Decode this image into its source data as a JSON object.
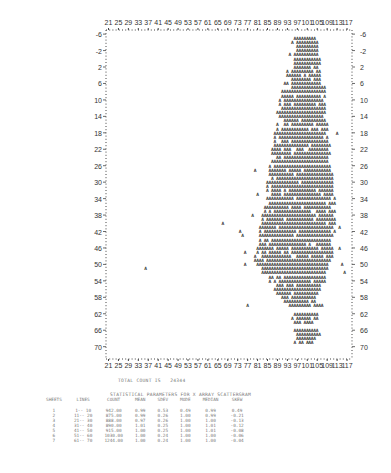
{
  "chart_data": {
    "type": "scatter",
    "title": "",
    "render_style": "line-printer character scattergram",
    "marker_glyph": "A",
    "x_ticks": [
      21,
      25,
      29,
      33,
      37,
      41,
      45,
      49,
      53,
      57,
      61,
      65,
      69,
      73,
      77,
      81,
      85,
      89,
      93,
      97,
      101,
      105,
      109,
      113,
      117
    ],
    "y_ticks": [
      -6,
      -2,
      2,
      6,
      10,
      14,
      18,
      22,
      26,
      30,
      34,
      38,
      42,
      46,
      50,
      54,
      58,
      62,
      66,
      70
    ],
    "xlim": [
      20,
      119
    ],
    "ylim": [
      -7,
      73
    ],
    "y_axis_inverted": true,
    "grid": false,
    "density_rows": [
      {
        "y": -5,
        "xmin": 96,
        "xmax": 104
      },
      {
        "y": -4,
        "xmin": 95,
        "xmax": 105
      },
      {
        "y": -3,
        "xmin": 95,
        "xmax": 105
      },
      {
        "y": -2,
        "xmin": 95,
        "xmax": 106
      },
      {
        "y": -1,
        "xmin": 94,
        "xmax": 105
      },
      {
        "y": 0,
        "xmin": 94,
        "xmax": 106
      },
      {
        "y": 1,
        "xmin": 94,
        "xmax": 106
      },
      {
        "y": 2,
        "xmin": 94,
        "xmax": 105
      },
      {
        "y": 3,
        "xmin": 93,
        "xmax": 106
      },
      {
        "y": 4,
        "xmin": 93,
        "xmax": 106
      },
      {
        "y": 5,
        "xmin": 93,
        "xmax": 107
      },
      {
        "y": 6,
        "xmin": 92,
        "xmax": 107
      },
      {
        "y": 7,
        "xmin": 92,
        "xmax": 108
      },
      {
        "y": 8,
        "xmin": 91,
        "xmax": 108
      },
      {
        "y": 9,
        "xmin": 91,
        "xmax": 108
      },
      {
        "y": 10,
        "xmin": 90,
        "xmax": 108
      },
      {
        "y": 11,
        "xmin": 90,
        "xmax": 108
      },
      {
        "y": 12,
        "xmin": 90,
        "xmax": 108
      },
      {
        "y": 13,
        "xmin": 89,
        "xmax": 108
      },
      {
        "y": 14,
        "xmin": 89,
        "xmax": 108
      },
      {
        "y": 15,
        "xmin": 89,
        "xmax": 108
      },
      {
        "y": 16,
        "xmin": 89,
        "xmax": 109
      },
      {
        "y": 17,
        "xmin": 89,
        "xmax": 109
      },
      {
        "y": 18,
        "xmin": 88,
        "xmax": 109
      },
      {
        "y": 19,
        "xmin": 88,
        "xmax": 109
      },
      {
        "y": 20,
        "xmin": 88,
        "xmax": 109
      },
      {
        "y": 21,
        "xmin": 88,
        "xmax": 110
      },
      {
        "y": 22,
        "xmin": 87,
        "xmax": 110
      },
      {
        "y": 23,
        "xmin": 87,
        "xmax": 110
      },
      {
        "y": 24,
        "xmin": 87,
        "xmax": 110
      },
      {
        "y": 25,
        "xmin": 87,
        "xmax": 110
      },
      {
        "y": 26,
        "xmin": 86,
        "xmax": 110
      },
      {
        "y": 27,
        "xmin": 86,
        "xmax": 110
      },
      {
        "y": 28,
        "xmin": 86,
        "xmax": 111
      },
      {
        "y": 29,
        "xmin": 86,
        "xmax": 111
      },
      {
        "y": 30,
        "xmin": 85,
        "xmax": 111
      },
      {
        "y": 31,
        "xmin": 85,
        "xmax": 111
      },
      {
        "y": 32,
        "xmin": 85,
        "xmax": 111
      },
      {
        "y": 33,
        "xmin": 85,
        "xmax": 111
      },
      {
        "y": 34,
        "xmin": 84,
        "xmax": 112
      },
      {
        "y": 35,
        "xmin": 84,
        "xmax": 112
      },
      {
        "y": 36,
        "xmin": 84,
        "xmax": 112
      },
      {
        "y": 37,
        "xmin": 84,
        "xmax": 112
      },
      {
        "y": 38,
        "xmin": 83,
        "xmax": 112
      },
      {
        "y": 39,
        "xmin": 83,
        "xmax": 112
      },
      {
        "y": 40,
        "xmin": 83,
        "xmax": 112
      },
      {
        "y": 41,
        "xmin": 82,
        "xmax": 112
      },
      {
        "y": 42,
        "xmin": 82,
        "xmax": 112
      },
      {
        "y": 43,
        "xmin": 82,
        "xmax": 112
      },
      {
        "y": 44,
        "xmin": 82,
        "xmax": 111
      },
      {
        "y": 45,
        "xmin": 81,
        "xmax": 111
      },
      {
        "y": 46,
        "xmin": 81,
        "xmax": 111
      },
      {
        "y": 47,
        "xmin": 81,
        "xmax": 111
      },
      {
        "y": 48,
        "xmin": 80,
        "xmax": 111
      },
      {
        "y": 49,
        "xmin": 80,
        "xmax": 110
      },
      {
        "y": 50,
        "xmin": 81,
        "xmax": 110
      },
      {
        "y": 51,
        "xmin": 82,
        "xmax": 110
      },
      {
        "y": 52,
        "xmin": 83,
        "xmax": 109
      },
      {
        "y": 53,
        "xmin": 85,
        "xmax": 108
      },
      {
        "y": 54,
        "xmin": 86,
        "xmax": 108
      },
      {
        "y": 55,
        "xmin": 87,
        "xmax": 107
      },
      {
        "y": 56,
        "xmin": 88,
        "xmax": 106
      },
      {
        "y": 57,
        "xmin": 89,
        "xmax": 105
      },
      {
        "y": 58,
        "xmin": 90,
        "xmax": 104
      },
      {
        "y": 59,
        "xmin": 91,
        "xmax": 105
      },
      {
        "y": 60,
        "xmin": 94,
        "xmax": 107
      },
      {
        "y": 62,
        "xmin": 95,
        "xmax": 106
      },
      {
        "y": 63,
        "xmin": 95,
        "xmax": 105
      },
      {
        "y": 64,
        "xmin": 95,
        "xmax": 104
      },
      {
        "y": 66,
        "xmin": 96,
        "xmax": 105
      },
      {
        "y": 67,
        "xmin": 95,
        "xmax": 106
      },
      {
        "y": 68,
        "xmin": 95,
        "xmax": 104
      },
      {
        "y": 69,
        "xmin": 96,
        "xmax": 103
      }
    ],
    "outliers": [
      {
        "x": 36,
        "y": 51
      },
      {
        "x": 67,
        "y": 40
      },
      {
        "x": 74,
        "y": 42
      },
      {
        "x": 75,
        "y": 43
      },
      {
        "x": 76,
        "y": 47
      },
      {
        "x": 76,
        "y": 50
      },
      {
        "x": 77,
        "y": 60
      },
      {
        "x": 79,
        "y": 38
      },
      {
        "x": 80,
        "y": 27
      },
      {
        "x": 81,
        "y": 33
      },
      {
        "x": 113,
        "y": 18
      },
      {
        "x": 114,
        "y": 41
      },
      {
        "x": 114,
        "y": 46
      },
      {
        "x": 115,
        "y": 50
      },
      {
        "x": 116,
        "y": 52
      }
    ]
  },
  "footer": {
    "total_count_label": "TOTAL COUNT IS",
    "total_count": "24344"
  },
  "stats": {
    "title": "STATISTICAL PARAMETERS FOR X ARRAY SCATTERGRAM",
    "headers": [
      "SHEETS",
      "LINES",
      "COUNT",
      "MEAN",
      "SDEV",
      "MODE",
      "MEDIAN",
      "SKEW"
    ],
    "rows": [
      [
        "1",
        "1-- 10",
        "942.00",
        "0.99",
        "0.53",
        "0.49",
        "0.99",
        "0.49"
      ],
      [
        "2",
        "11-- 20",
        "875.00",
        "0.99",
        "0.26",
        "1.00",
        "0.99",
        "-0.21"
      ],
      [
        "3",
        "21-- 30",
        "888.00",
        "0.97",
        "0.26",
        "1.00",
        "1.00",
        "-0.13"
      ],
      [
        "4",
        "31-- 40",
        "890.00",
        "1.01",
        "0.25",
        "1.00",
        "1.01",
        "-0.12"
      ],
      [
        "5",
        "41-- 50",
        "915.00",
        "1.00",
        "0.25",
        "1.00",
        "1.01",
        "-0.08"
      ],
      [
        "6",
        "51-- 60",
        "1030.00",
        "1.00",
        "0.24",
        "1.00",
        "1.00",
        "-0.06"
      ],
      [
        "7",
        "61-- 70",
        "1244.00",
        "1.00",
        "0.24",
        "1.00",
        "1.00",
        "-0.04"
      ]
    ]
  },
  "colors": {
    "ink": "#2a2a2a",
    "faint_ink": "#7a7a7a",
    "paper": "#ffffff"
  }
}
